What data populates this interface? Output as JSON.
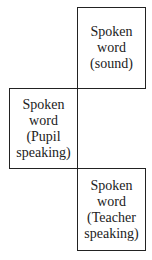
{
  "diagram": {
    "boxes": [
      {
        "lines": [
          "Spoken",
          "word",
          "(sound)"
        ]
      },
      {
        "lines": [
          "Spoken",
          "word",
          "(Pupil",
          "speaking)"
        ]
      },
      {
        "lines": [
          "Spoken",
          "word",
          "(Teacher",
          "speaking)"
        ]
      }
    ]
  }
}
